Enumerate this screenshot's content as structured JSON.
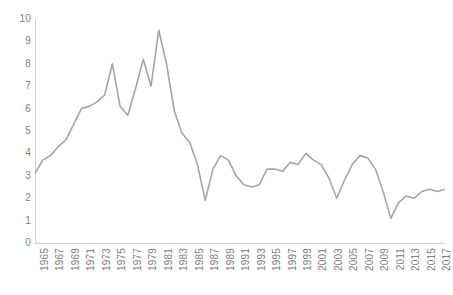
{
  "chart_data": {
    "type": "line",
    "title": "",
    "subtitle": "",
    "xlabel": "",
    "ylabel": "",
    "xlim": [
      1965,
      2018
    ],
    "ylim": [
      0,
      10
    ],
    "grid": false,
    "legend": false,
    "legend_position": "none",
    "line_color": "#a5a5a5",
    "axis_color": "#d0d0d0",
    "tick_label_color": "#808080",
    "y_ticks": [
      "0",
      "1",
      "2",
      "3",
      "4",
      "5",
      "6",
      "7",
      "8",
      "9",
      "10"
    ],
    "x_tick_labels": [
      "1965",
      "1967",
      "1969",
      "1971",
      "1973",
      "1975",
      "1977",
      "1979",
      "1981",
      "1983",
      "1985",
      "1987",
      "1989",
      "1991",
      "1993",
      "1995",
      "1997",
      "1999",
      "2001",
      "2003",
      "2005",
      "2007",
      "2009",
      "2011",
      "2013",
      "2015",
      "2017"
    ],
    "x": [
      1965,
      1966,
      1967,
      1968,
      1969,
      1970,
      1971,
      1972,
      1973,
      1974,
      1975,
      1976,
      1977,
      1978,
      1979,
      1980,
      1981,
      1982,
      1983,
      1984,
      1985,
      1986,
      1987,
      1988,
      1989,
      1990,
      1991,
      1992,
      1993,
      1994,
      1995,
      1996,
      1997,
      1998,
      1999,
      2000,
      2001,
      2002,
      2003,
      2004,
      2005,
      2006,
      2007,
      2008,
      2009,
      2010,
      2011,
      2012,
      2013,
      2014,
      2015,
      2016,
      2017,
      2018
    ],
    "values": [
      3.1,
      3.7,
      3.9,
      4.3,
      4.6,
      5.3,
      6.0,
      6.1,
      6.3,
      6.6,
      8.0,
      6.1,
      5.7,
      6.9,
      8.2,
      7.0,
      9.5,
      8.0,
      5.9,
      4.9,
      4.5,
      3.5,
      1.9,
      3.3,
      3.9,
      3.7,
      3.0,
      2.6,
      2.5,
      2.6,
      3.3,
      3.3,
      3.2,
      3.6,
      3.5,
      4.0,
      3.7,
      3.5,
      2.9,
      2.0,
      2.8,
      3.5,
      3.9,
      3.8,
      3.3,
      2.3,
      1.1,
      1.8,
      2.1,
      2.0,
      2.3,
      2.4,
      2.3,
      2.4
    ],
    "series": [
      {
        "name": "series-1",
        "color": "#a5a5a5",
        "values": [
          3.1,
          3.7,
          3.9,
          4.3,
          4.6,
          5.3,
          6.0,
          6.1,
          6.3,
          6.6,
          8.0,
          6.1,
          5.7,
          6.9,
          8.2,
          7.0,
          9.5,
          8.0,
          5.9,
          4.9,
          4.5,
          3.5,
          1.9,
          3.3,
          3.9,
          3.7,
          3.0,
          2.6,
          2.5,
          2.6,
          3.3,
          3.3,
          3.2,
          3.6,
          3.5,
          4.0,
          3.7,
          3.5,
          2.9,
          2.0,
          2.8,
          3.5,
          3.9,
          3.8,
          3.3,
          2.3,
          1.1,
          1.8,
          2.1,
          2.0,
          2.3,
          2.4,
          2.3,
          2.4
        ]
      }
    ]
  }
}
